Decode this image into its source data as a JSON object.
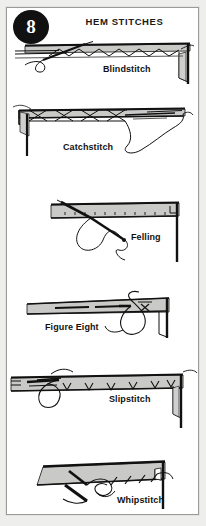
{
  "card": {
    "badge_number": "8",
    "title": "HEM STITCHES",
    "frame_color": "#9a9a96",
    "background_color": "#eeeeec",
    "page_color": "#ffffff",
    "ink_color": "#111111",
    "fabric_fill": "#c9c9c7"
  },
  "panels": [
    {
      "id": "blindstitch",
      "label": "Blindstitch",
      "description": "Hem fold with zigzag blind stitches worked under the folded edge, needle and thread entering from the left."
    },
    {
      "id": "catchstitch",
      "label": "Catchstitch",
      "description": "Crossed X-shaped catch stitches worked left to right along the hem edge with a looping thread tail at right."
    },
    {
      "id": "felling",
      "label": "Felling",
      "description": "Felling stitch taken through the hem fold with a long needle and a curling thread loop below."
    },
    {
      "id": "figure-eight",
      "label": "Figure Eight",
      "description": "Figure eight stitch formed by a looping thread crossing over itself at the hem edge."
    },
    {
      "id": "slipstitch",
      "label": "Slipstitch",
      "description": "Row of small V slip stitches along the underside of the hem fold with a thread loop at the left."
    },
    {
      "id": "whipstitch",
      "label": "Whipstitch",
      "description": "Slanted whip stitches over a raw hem edge with needle passing through and a trailing thread."
    }
  ]
}
